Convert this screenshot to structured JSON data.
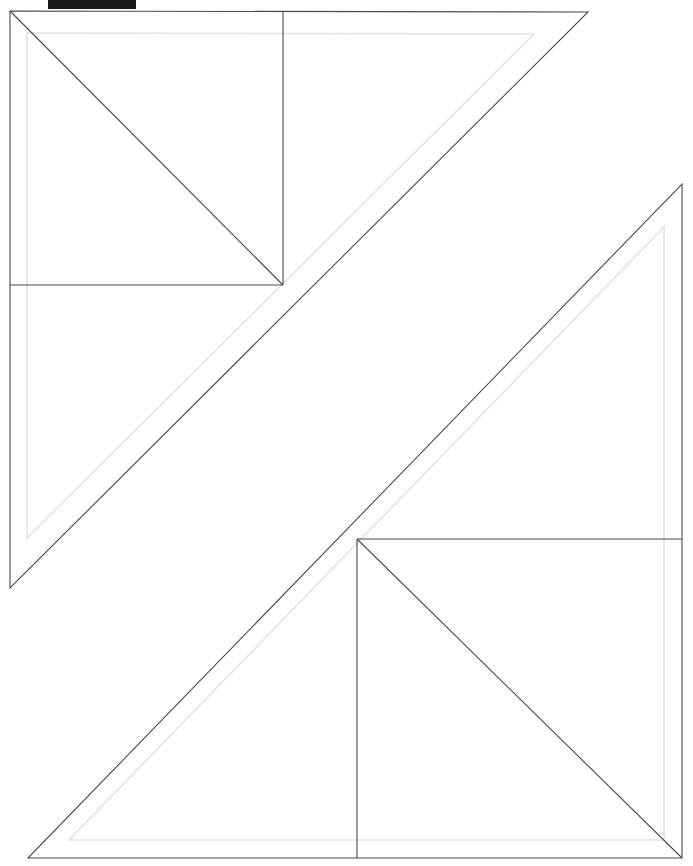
{
  "document": {
    "title": "Geometric Line Drawing",
    "background_color": "#ffffff",
    "width": 693,
    "height": 866
  },
  "style": {
    "primary_stroke_color": "#4a4a4e",
    "primary_stroke_width": 1.1,
    "secondary_stroke_color": "#e3e3e3",
    "secondary_stroke_width": 1.6
  },
  "redaction": {
    "label": "redacted-header-bar",
    "text": "████████",
    "color": "#16181a",
    "x": 48,
    "y": 0,
    "width": 88,
    "height": 9
  },
  "figure": {
    "name": "two-nested-right-triangles",
    "shapes": [
      {
        "id": "upper-left-outer-triangle",
        "type": "polygon",
        "stroke": "primary",
        "points": "10,11 588,12 10,588"
      },
      {
        "id": "upper-left-inner-triangle",
        "type": "polygon",
        "stroke": "secondary",
        "points": "27,33 534,34 27,538"
      },
      {
        "id": "upper-left-square-right-edge",
        "type": "line",
        "stroke": "primary",
        "points": "283,12 283,285"
      },
      {
        "id": "upper-left-square-bottom-edge",
        "type": "line",
        "stroke": "primary",
        "points": "10,285 283,285"
      },
      {
        "id": "upper-left-square-diagonal",
        "type": "line",
        "stroke": "primary",
        "points": "10,11 283,285"
      },
      {
        "id": "lower-right-outer-triangle",
        "type": "polygon",
        "stroke": "primary",
        "points": "682,184 682,858 28,858"
      },
      {
        "id": "lower-right-inner-triangle",
        "type": "polygon",
        "stroke": "secondary",
        "points": "664,227 664,840 69,840"
      },
      {
        "id": "lower-right-square-top-edge",
        "type": "line",
        "stroke": "primary",
        "points": "357,539 682,539"
      },
      {
        "id": "lower-right-square-left-edge",
        "type": "line",
        "stroke": "primary",
        "points": "357,539 357,858"
      },
      {
        "id": "lower-right-square-diagonal",
        "type": "line",
        "stroke": "primary",
        "points": "357,539 682,858"
      }
    ]
  }
}
